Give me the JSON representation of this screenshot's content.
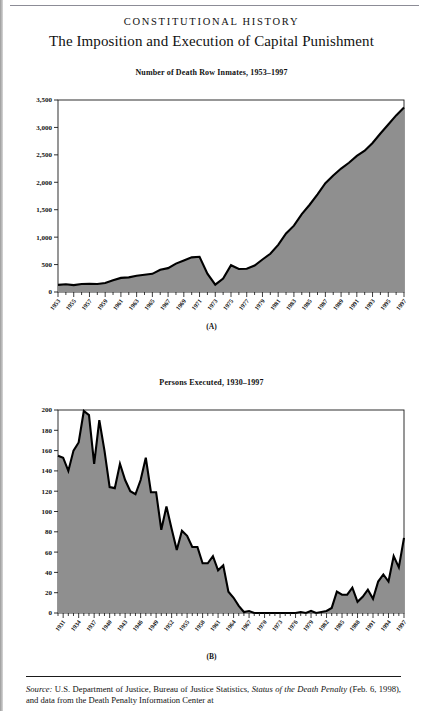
{
  "header": {
    "running_head": "CONSTITUTIONAL HISTORY",
    "title": "The Imposition and Execution of Capital Punishment"
  },
  "source_note": {
    "label": "Source:",
    "text_1": " U.S. Department of Justice, Bureau of Justice Statistics, ",
    "italic_1": "Status of the Death Penalty",
    "text_2": " (Feb. 6, 1998), and data from the Death Penalty Information Center at"
  },
  "figures": [
    {
      "caption": "(A)",
      "chart_data": {
        "type": "area",
        "title": "Number of Death Row Inmates, 1953–1997",
        "xlabel": "",
        "ylabel": "",
        "ylim": [
          0,
          3500
        ],
        "yticks": [
          0,
          500,
          1000,
          1500,
          2000,
          2500,
          3000,
          3500
        ],
        "ytick_labels": [
          "0",
          "500",
          "1,000",
          "1,500",
          "2,000",
          "2,500",
          "3,000",
          "3,500"
        ],
        "xlim": [
          1953,
          1997
        ],
        "xticks": [
          1953,
          1955,
          1957,
          1959,
          1961,
          1963,
          1965,
          1967,
          1969,
          1971,
          1973,
          1975,
          1977,
          1979,
          1981,
          1983,
          1985,
          1987,
          1989,
          1991,
          1993,
          1995,
          1997
        ],
        "xtick_labels": [
          "1953",
          "1955",
          "1957",
          "1959",
          "1961",
          "1963",
          "1965",
          "1967",
          "1969",
          "1971",
          "1973",
          "1975",
          "1977",
          "1979",
          "1981",
          "1983",
          "1985",
          "1987",
          "1989",
          "1991",
          "1993",
          "1995",
          "1997"
        ],
        "minor_ticks": true,
        "grid": false,
        "legend": "none",
        "fill_color": "#8f8f8f",
        "line_color": "#000000",
        "x": [
          1953,
          1954,
          1955,
          1956,
          1957,
          1958,
          1959,
          1960,
          1961,
          1962,
          1963,
          1964,
          1965,
          1966,
          1967,
          1968,
          1969,
          1970,
          1971,
          1972,
          1973,
          1974,
          1975,
          1976,
          1977,
          1978,
          1979,
          1980,
          1981,
          1982,
          1983,
          1984,
          1985,
          1986,
          1987,
          1988,
          1989,
          1990,
          1991,
          1992,
          1993,
          1994,
          1995,
          1996,
          1997
        ],
        "values": [
          130,
          140,
          125,
          146,
          151,
          147,
          164,
          212,
          257,
          267,
          297,
          315,
          331,
          406,
          435,
          517,
          575,
          631,
          642,
          334,
          134,
          244,
          488,
          420,
          423,
          482,
          593,
          697,
          860,
          1066,
          1209,
          1420,
          1591,
          1781,
          1984,
          2124,
          2250,
          2356,
          2482,
          2575,
          2716,
          2890,
          3054,
          3219,
          3365
        ]
      }
    },
    {
      "caption": "(B)",
      "chart_data": {
        "type": "area",
        "title": "Persons Executed, 1930–1997",
        "xlabel": "",
        "ylabel": "",
        "ylim": [
          0,
          200
        ],
        "yticks": [
          0,
          20,
          40,
          60,
          80,
          100,
          120,
          140,
          160,
          180,
          200
        ],
        "ytick_labels": [
          "0",
          "20",
          "40",
          "60",
          "80",
          "100",
          "120",
          "140",
          "160",
          "180",
          "200"
        ],
        "xlim": [
          1930,
          1997
        ],
        "xticks": [
          1931,
          1934,
          1937,
          1940,
          1943,
          1946,
          1949,
          1952,
          1955,
          1958,
          1961,
          1964,
          1967,
          1970,
          1973,
          1976,
          1979,
          1982,
          1985,
          1988,
          1991,
          1994,
          1997
        ],
        "xtick_labels": [
          "1931",
          "1934",
          "1937",
          "1940",
          "1943",
          "1946",
          "1949",
          "1952",
          "1955",
          "1958",
          "1961",
          "1964",
          "1967",
          "1970",
          "1973",
          "1976",
          "1979",
          "1982",
          "1985",
          "1988",
          "1991",
          "1994",
          "1997"
        ],
        "minor_ticks": true,
        "grid": false,
        "legend": "none",
        "fill_color": "#8f8f8f",
        "line_color": "#000000",
        "x": [
          1930,
          1931,
          1932,
          1933,
          1934,
          1935,
          1936,
          1937,
          1938,
          1939,
          1940,
          1941,
          1942,
          1943,
          1944,
          1945,
          1946,
          1947,
          1948,
          1949,
          1950,
          1951,
          1952,
          1953,
          1954,
          1955,
          1956,
          1957,
          1958,
          1959,
          1960,
          1961,
          1962,
          1963,
          1964,
          1965,
          1966,
          1967,
          1968,
          1969,
          1970,
          1971,
          1972,
          1973,
          1974,
          1975,
          1976,
          1977,
          1978,
          1979,
          1980,
          1981,
          1982,
          1983,
          1984,
          1985,
          1986,
          1987,
          1988,
          1989,
          1990,
          1991,
          1992,
          1993,
          1994,
          1995,
          1996,
          1997
        ],
        "values": [
          155,
          153,
          140,
          160,
          168,
          199,
          195,
          147,
          190,
          160,
          124,
          123,
          147,
          131,
          120,
          117,
          131,
          153,
          119,
          119,
          82,
          105,
          83,
          62,
          81,
          76,
          65,
          65,
          49,
          49,
          56,
          42,
          47,
          21,
          15,
          7,
          1,
          2,
          0,
          0,
          0,
          0,
          0,
          0,
          0,
          0,
          0,
          1,
          0,
          2,
          0,
          1,
          2,
          5,
          21,
          18,
          18,
          25,
          11,
          16,
          23,
          14,
          31,
          38,
          31,
          56,
          45,
          74
        ]
      }
    }
  ]
}
